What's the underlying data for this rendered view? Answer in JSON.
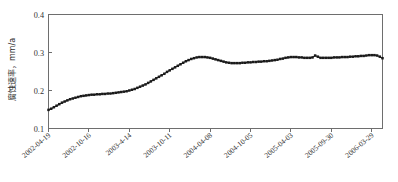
{
  "chart_data": {
    "type": "line",
    "title": "",
    "xlabel": "",
    "ylabel": "腐蚀速率，mm/a",
    "ylabel_parts": {
      "name": "腐蚀速率",
      "separator": "，",
      "unit": "mm/a"
    },
    "ylim": [
      0.1,
      0.4
    ],
    "yticks": [
      0.1,
      0.2,
      0.3,
      0.4
    ],
    "ytick_labels": [
      "0.1",
      "0.2",
      "0.3",
      "0.4"
    ],
    "xtick_labels": [
      "2002-04-19",
      "2002-10-16",
      "2003-4-14",
      "2003-10-11",
      "2004-04-08",
      "2004-10-05",
      "2005-04-03",
      "2005-09-30",
      "2006-03-29"
    ],
    "xtick_index": [
      0,
      15,
      30,
      45,
      60,
      75,
      90,
      105,
      120
    ],
    "grid": false,
    "legend": null,
    "marker": "filled-square",
    "marker_color": "#1a1a1a",
    "line_color": "#1a1a1a",
    "series": [
      {
        "name": "腐蚀速率",
        "x_start_label": "2002-04-19",
        "x_end_label": "2006-03-29",
        "n_points": 121,
        "values": [
          0.149,
          0.152,
          0.156,
          0.16,
          0.164,
          0.168,
          0.171,
          0.174,
          0.177,
          0.179,
          0.181,
          0.183,
          0.185,
          0.186,
          0.187,
          0.188,
          0.189,
          0.189,
          0.19,
          0.19,
          0.191,
          0.191,
          0.192,
          0.192,
          0.193,
          0.194,
          0.195,
          0.196,
          0.197,
          0.198,
          0.2,
          0.202,
          0.204,
          0.207,
          0.21,
          0.213,
          0.216,
          0.22,
          0.224,
          0.228,
          0.232,
          0.236,
          0.24,
          0.244,
          0.249,
          0.253,
          0.257,
          0.261,
          0.265,
          0.269,
          0.273,
          0.277,
          0.28,
          0.283,
          0.285,
          0.287,
          0.288,
          0.288,
          0.288,
          0.287,
          0.286,
          0.284,
          0.282,
          0.28,
          0.278,
          0.276,
          0.274,
          0.273,
          0.272,
          0.272,
          0.272,
          0.272,
          0.273,
          0.273,
          0.274,
          0.274,
          0.275,
          0.275,
          0.276,
          0.276,
          0.277,
          0.277,
          0.278,
          0.279,
          0.28,
          0.281,
          0.283,
          0.284,
          0.286,
          0.287,
          0.288,
          0.288,
          0.288,
          0.287,
          0.287,
          0.286,
          0.286,
          0.286,
          0.287,
          0.292,
          0.289,
          0.286,
          0.286,
          0.286,
          0.286,
          0.286,
          0.287,
          0.287,
          0.287,
          0.288,
          0.288,
          0.288,
          0.289,
          0.289,
          0.29,
          0.29,
          0.291,
          0.291,
          0.292,
          0.293,
          0.293,
          0.293,
          0.292,
          0.289,
          0.285
        ]
      }
    ]
  }
}
